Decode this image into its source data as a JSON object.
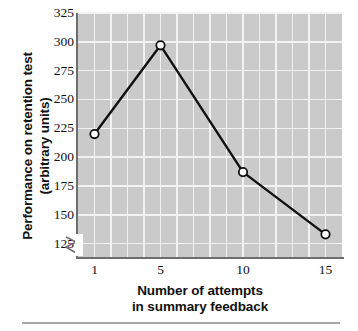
{
  "chart_data": {
    "type": "line",
    "title": "",
    "xlabel": "Number of attempts in summary feedback",
    "xlabel_line1": "Number of attempts",
    "xlabel_line2": "in summary feedback",
    "ylabel": "Performance on retention test (arbitrary units)",
    "ylabel_line1": "Performance on retention test",
    "ylabel_line2": "(arbitrary units)",
    "x": [
      1,
      5,
      10,
      15
    ],
    "values": [
      220,
      297,
      187,
      133
    ],
    "xtick_labels": [
      "1",
      "5",
      "10",
      "15"
    ],
    "ytick_labels": [
      "325",
      "300",
      "275",
      "250",
      "225",
      "200",
      "175",
      "150",
      "125"
    ],
    "ytick_values": [
      325,
      300,
      275,
      250,
      225,
      200,
      175,
      150,
      125
    ],
    "ylim": [
      112.5,
      325
    ],
    "xlim": [
      0,
      16
    ],
    "grid": true,
    "y_axis_break": true,
    "legend": "none",
    "marker": "open-circle",
    "series": [
      {
        "name": "Retention performance",
        "x": [
          1,
          5,
          10,
          15
        ],
        "values": [
          220,
          297,
          187,
          133
        ]
      }
    ]
  },
  "style": {
    "plot_background": "#cacaca",
    "gridline_color": "#f2f2f2",
    "axis_color": "#6e6e6e",
    "line_color": "#111111",
    "marker_fill": "#ffffff",
    "text_color": "#111111",
    "page_background": "#ffffff",
    "rule_color": "#a8a8a8"
  },
  "icons": {
    "axis_break": "axis-break-icon"
  }
}
